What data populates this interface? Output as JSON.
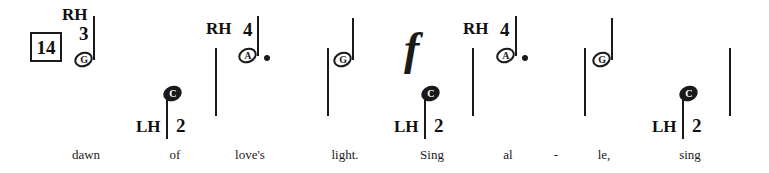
{
  "score": {
    "width": 769,
    "height": 173,
    "background": "#ffffff",
    "ink": "#1a1a1a",
    "measure_number": "14",
    "notation_style": "letter-noteheads"
  },
  "measure_box": {
    "label": "14",
    "x": 30,
    "y": 32,
    "width": 32,
    "height": 30,
    "font_size": 19
  },
  "hand_labels": [
    {
      "id": "rh-1",
      "text": "RH",
      "x": 62,
      "y": 6,
      "font_size": 17
    },
    {
      "id": "rh-2",
      "text": "RH",
      "x": 206,
      "y": 20,
      "font_size": 17
    },
    {
      "id": "rh-3",
      "text": "RH",
      "x": 463,
      "y": 20,
      "font_size": 17
    },
    {
      "id": "lh-1",
      "text": "LH",
      "x": 136,
      "y": 118,
      "font_size": 17
    },
    {
      "id": "lh-2",
      "text": "LH",
      "x": 394,
      "y": 118,
      "font_size": 17
    },
    {
      "id": "lh-3",
      "text": "LH",
      "x": 652,
      "y": 118,
      "font_size": 17
    }
  ],
  "finger_numbers": [
    {
      "id": "f-rh-1",
      "text": "3",
      "x": 79,
      "y": 24,
      "font_size": 19
    },
    {
      "id": "f-rh-2",
      "text": "4",
      "x": 243,
      "y": 20,
      "font_size": 19
    },
    {
      "id": "f-rh-3",
      "text": "4",
      "x": 500,
      "y": 20,
      "font_size": 19
    },
    {
      "id": "f-lh-1",
      "text": "2",
      "x": 176,
      "y": 116,
      "font_size": 19
    },
    {
      "id": "f-lh-2",
      "text": "2",
      "x": 434,
      "y": 116,
      "font_size": 19
    },
    {
      "id": "f-lh-3",
      "text": "2",
      "x": 692,
      "y": 116,
      "font_size": 19
    }
  ],
  "notes": [
    {
      "id": "note-1",
      "letter": "G",
      "head_style": "hollow",
      "hand": "RH",
      "finger": "3",
      "dotted": false,
      "lyric": "dawn",
      "head_x": 74,
      "head_y": 52,
      "stem_x": 93,
      "stem_y": 16,
      "stem_height": 44
    },
    {
      "id": "note-2",
      "letter": "C",
      "head_style": "filled",
      "hand": "LH",
      "finger": "2",
      "dotted": false,
      "lyric": "of",
      "head_x": 163,
      "head_y": 86,
      "stem_x": 166,
      "stem_y": 96,
      "stem_height": 43
    },
    {
      "id": "note-3",
      "letter": "A",
      "head_style": "hollow",
      "hand": "RH",
      "finger": "4",
      "dotted": true,
      "lyric": "love's",
      "head_x": 238,
      "head_y": 48,
      "stem_x": 257,
      "stem_y": 16,
      "stem_height": 40,
      "dot_x": 264,
      "dot_y": 55
    },
    {
      "id": "note-4",
      "letter": "G",
      "head_style": "hollow",
      "hand": "",
      "finger": "",
      "dotted": false,
      "lyric": "light.",
      "head_x": 333,
      "head_y": 52,
      "stem_x": 352,
      "stem_y": 18,
      "stem_height": 42
    },
    {
      "id": "note-5",
      "letter": "C",
      "head_style": "filled",
      "hand": "LH",
      "finger": "2",
      "dotted": false,
      "lyric": "Sing",
      "head_x": 421,
      "head_y": 86,
      "stem_x": 424,
      "stem_y": 96,
      "stem_height": 43
    },
    {
      "id": "note-6",
      "letter": "A",
      "head_style": "hollow",
      "hand": "RH",
      "finger": "4",
      "dotted": true,
      "lyric": "al",
      "head_x": 496,
      "head_y": 48,
      "stem_x": 515,
      "stem_y": 16,
      "stem_height": 40,
      "dot_x": 522,
      "dot_y": 55
    },
    {
      "id": "note-7",
      "letter": "G",
      "head_style": "hollow",
      "hand": "",
      "finger": "",
      "dotted": false,
      "lyric": "le,",
      "head_x": 592,
      "head_y": 52,
      "stem_x": 611,
      "stem_y": 18,
      "stem_height": 42
    },
    {
      "id": "note-8",
      "letter": "C",
      "head_style": "filled",
      "hand": "LH",
      "finger": "2",
      "dotted": false,
      "lyric": "sing",
      "head_x": 679,
      "head_y": 86,
      "stem_x": 682,
      "stem_y": 96,
      "stem_height": 43
    }
  ],
  "ticks": [
    {
      "id": "tick-1",
      "x": 215,
      "y": 48,
      "height": 68
    },
    {
      "id": "tick-2",
      "x": 327,
      "y": 48,
      "height": 68
    },
    {
      "id": "tick-3",
      "x": 472,
      "y": 48,
      "height": 68
    },
    {
      "id": "tick-4",
      "x": 584,
      "y": 48,
      "height": 68
    },
    {
      "id": "tick-5",
      "x": 729,
      "y": 48,
      "height": 68
    }
  ],
  "dynamics": [
    {
      "id": "forte-1",
      "symbol": "f",
      "name": "forte",
      "x": 404,
      "y": 26,
      "font_size": 46
    }
  ],
  "lyrics": [
    {
      "id": "lyric-1",
      "text": "dawn",
      "x": 86,
      "y": 148
    },
    {
      "id": "lyric-2",
      "text": "of",
      "x": 175,
      "y": 148
    },
    {
      "id": "lyric-3",
      "text": "love's",
      "x": 250,
      "y": 148
    },
    {
      "id": "lyric-4",
      "text": "light.",
      "x": 345,
      "y": 148
    },
    {
      "id": "lyric-5",
      "text": "Sing",
      "x": 432,
      "y": 148
    },
    {
      "id": "lyric-6",
      "text": "al",
      "x": 508,
      "y": 148
    },
    {
      "id": "lyric-7",
      "text": "-",
      "x": 556,
      "y": 148
    },
    {
      "id": "lyric-8",
      "text": "le,",
      "x": 604,
      "y": 148
    },
    {
      "id": "lyric-9",
      "text": "sing",
      "x": 690,
      "y": 148
    }
  ]
}
